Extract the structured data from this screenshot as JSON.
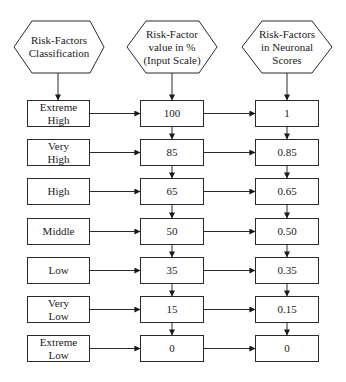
{
  "headers": [
    {
      "id": "classification",
      "label": "Risk-Factors\nClassification"
    },
    {
      "id": "input-scale",
      "label": "Risk-Factor\nvalue in %\n(Input Scale)"
    },
    {
      "id": "neuronal-scores",
      "label": "Risk-Factors\nin Neuronal\nScores"
    }
  ],
  "rows": [
    {
      "classification": "Extreme\nHigh",
      "percent": "100",
      "score": "1"
    },
    {
      "classification": "Very\nHigh",
      "percent": "85",
      "score": "0.85"
    },
    {
      "classification": "High",
      "percent": "65",
      "score": "0.65"
    },
    {
      "classification": "Middle",
      "percent": "50",
      "score": "0.50"
    },
    {
      "classification": "Low",
      "percent": "35",
      "score": "0.35"
    },
    {
      "classification": "Very\nLow",
      "percent": "15",
      "score": "0.15"
    },
    {
      "classification": "Extreme\nLow",
      "percent": "0",
      "score": "0"
    }
  ],
  "colors": {
    "stroke": "#2a2a2a",
    "background": "#ffffff",
    "text": "#1a1a1a"
  }
}
